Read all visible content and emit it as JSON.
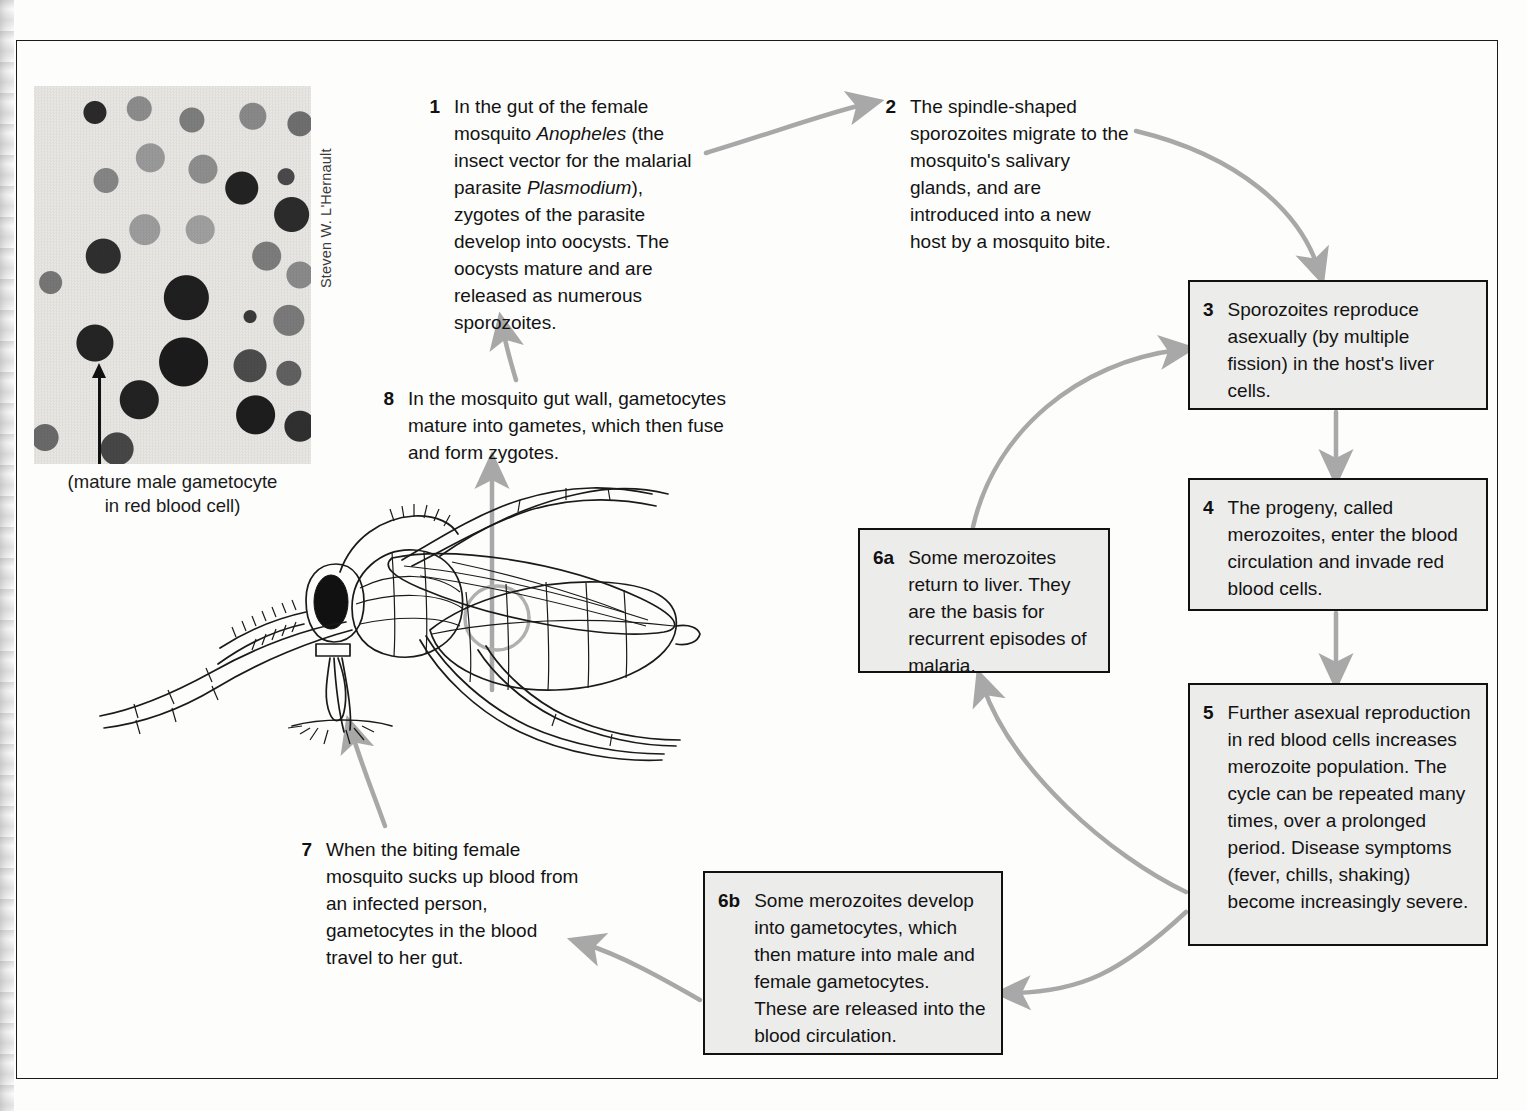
{
  "figure": {
    "box_fill": "#ececeb",
    "arrow_color": "#a8a8a8",
    "border_color": "#111111"
  },
  "micrograph": {
    "caption_line1": "(mature male gametocyte",
    "caption_line2": "in red blood cell)",
    "credit": "Steven W. L'Hernault",
    "arrow_label": "pointer to mature male gametocyte"
  },
  "steps": [
    {
      "id": "step-1",
      "num": "1",
      "text_parts": [
        {
          "t": "In the gut of the female mosquito ",
          "i": false
        },
        {
          "t": "Anopheles",
          "i": true
        },
        {
          "t": " (the insect vector for the malarial parasite ",
          "i": false
        },
        {
          "t": "Plasmodium",
          "i": true
        },
        {
          "t": "), zygotes of the parasite develop into oocysts. The oocysts mature and are released as numerous sporozoites.",
          "i": false
        }
      ],
      "plain": "In the gut of the female mosquito Anopheles (the insect vector for the malarial parasite Plasmodium), zygotes of the parasite develop into oocysts. The oocysts mature and are released as numerous sporozoites."
    },
    {
      "id": "step-2",
      "num": "2",
      "plain": "The spindle-shaped sporozoites migrate to the mosquito's salivary glands, and are introduced into a new host by a mosquito bite."
    },
    {
      "id": "step-3",
      "num": "3",
      "plain": "Sporozoites reproduce asexually (by multiple fission) in the host's liver cells."
    },
    {
      "id": "step-4",
      "num": "4",
      "plain": "The progeny, called merozoites, enter the blood circulation and invade red blood cells."
    },
    {
      "id": "step-5",
      "num": "5",
      "plain": "Further asexual reproduction in red blood cells increases merozoite population. The cycle can be repeated many times, over a prolonged period. Disease symptoms (fever, chills, shaking) become increasingly severe."
    },
    {
      "id": "step-6a",
      "num": "6a",
      "plain": "Some merozoites return to liver. They are the basis for recurrent episodes of malaria."
    },
    {
      "id": "step-6b",
      "num": "6b",
      "plain": "Some merozoites develop into gametocytes, which then mature into male and female gametocytes. These are released into the blood circulation."
    },
    {
      "id": "step-7",
      "num": "7",
      "plain": "When the biting female mosquito sucks up blood from an infected person, gametocytes in the blood travel to her gut."
    },
    {
      "id": "step-8",
      "num": "8",
      "plain": "In the mosquito gut wall, gametocytes mature into gametes, which then fuse and form zygotes."
    }
  ],
  "illustration": {
    "name": "anopheles-mosquito-line-drawing",
    "gut_marker": "circle highlighting mosquito gut"
  }
}
